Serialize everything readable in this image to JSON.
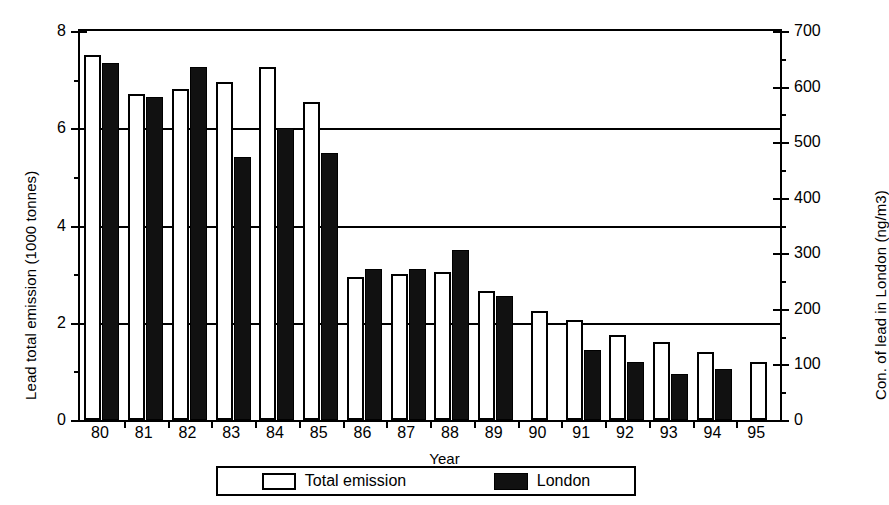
{
  "chart_data": {
    "type": "bar",
    "title": "",
    "xlabel": "Year",
    "categories": [
      "80",
      "81",
      "82",
      "83",
      "84",
      "85",
      "86",
      "87",
      "88",
      "89",
      "90",
      "91",
      "92",
      "93",
      "94",
      "95"
    ],
    "series": [
      {
        "name": "Total emission",
        "axis": "left",
        "color": "#ffffff",
        "style": "open",
        "values": [
          7.5,
          6.7,
          6.8,
          6.95,
          7.25,
          6.55,
          2.95,
          3.0,
          3.05,
          2.65,
          2.25,
          2.05,
          1.75,
          1.6,
          1.4,
          1.2
        ]
      },
      {
        "name": "London",
        "axis": "right",
        "color": "#111111",
        "style": "solid",
        "values": [
          7.35,
          6.65,
          7.25,
          5.4,
          6.0,
          5.5,
          3.1,
          3.1,
          3.5,
          2.55,
          null,
          1.45,
          1.2,
          0.95,
          1.05,
          null
        ],
        "values_right_axis": [
          643,
          582,
          634,
          473,
          525,
          481,
          271,
          271,
          306,
          223,
          null,
          127,
          105,
          83,
          92,
          null
        ]
      }
    ],
    "left_axis": {
      "label": "Lead total emission (1000 tonnes)",
      "min": 0,
      "max": 8,
      "major_ticks": [
        0,
        2,
        4,
        6,
        8
      ],
      "minor_ticks": [
        1,
        3,
        5,
        7
      ],
      "tick_labels": [
        "0",
        "2",
        "4",
        "6",
        "8"
      ]
    },
    "right_axis": {
      "label": "Con. of lead in London (ng/m3)",
      "min": 0,
      "max": 700,
      "major_ticks": [
        0,
        100,
        200,
        300,
        400,
        500,
        600,
        700
      ],
      "minor_ticks": [
        50,
        150,
        250,
        350,
        450,
        550,
        650
      ],
      "tick_labels": [
        "0",
        "100",
        "200",
        "300",
        "400",
        "500",
        "600",
        "700"
      ]
    },
    "gridlines": {
      "on": true,
      "left_values": [
        2,
        4,
        6,
        8
      ]
    },
    "legend": {
      "position": "bottom",
      "entries": [
        {
          "label": "Total emission",
          "style": "open"
        },
        {
          "label": "London",
          "style": "solid"
        }
      ]
    }
  }
}
